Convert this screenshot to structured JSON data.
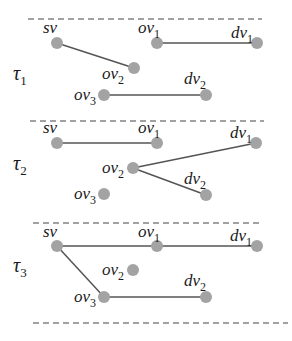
{
  "colors": {
    "node": "#a3a3a3",
    "edge": "#555555",
    "dash": "#444444",
    "text": "#1a1a1a",
    "background": "#ffffff"
  },
  "dividers": [
    {
      "y": 19,
      "x1": 28,
      "x2": 262
    },
    {
      "y": 121,
      "x1": 30,
      "x2": 264
    },
    {
      "y": 223,
      "x1": 33,
      "x2": 262
    },
    {
      "y": 323,
      "x1": 33,
      "x2": 288
    }
  ],
  "panels": [
    {
      "id": "tau1",
      "label": {
        "base": "τ",
        "sub": "1",
        "x": 13,
        "y": 80
      },
      "nodes": [
        {
          "id": "sv",
          "base": "sv",
          "sub": "",
          "x": 57,
          "y": 43,
          "lx": 43,
          "ly": 33
        },
        {
          "id": "ov1",
          "base": "ov",
          "sub": "1",
          "x": 157,
          "y": 43,
          "lx": 138,
          "ly": 33
        },
        {
          "id": "dv1",
          "base": "dv",
          "sub": "1",
          "x": 257,
          "y": 43,
          "lx": 231,
          "ly": 38
        },
        {
          "id": "ov2",
          "base": "ov",
          "sub": "2",
          "x": 134,
          "y": 68,
          "lx": 102,
          "ly": 79
        },
        {
          "id": "ov3",
          "base": "ov",
          "sub": "3",
          "x": 104,
          "y": 95,
          "lx": 74,
          "ly": 100
        },
        {
          "id": "dv2",
          "base": "dv",
          "sub": "2",
          "x": 206,
          "y": 95,
          "lx": 184,
          "ly": 84
        }
      ],
      "edges": [
        [
          "sv",
          "ov2"
        ],
        [
          "ov1",
          "dv1"
        ],
        [
          "ov3",
          "dv2"
        ]
      ]
    },
    {
      "id": "tau2",
      "label": {
        "base": "τ",
        "sub": "2",
        "x": 13,
        "y": 170
      },
      "nodes": [
        {
          "id": "sv",
          "base": "sv",
          "sub": "",
          "x": 57,
          "y": 143,
          "lx": 43,
          "ly": 133
        },
        {
          "id": "ov1",
          "base": "ov",
          "sub": "1",
          "x": 157,
          "y": 143,
          "lx": 138,
          "ly": 133
        },
        {
          "id": "dv1",
          "base": "dv",
          "sub": "1",
          "x": 256,
          "y": 143,
          "lx": 230,
          "ly": 138
        },
        {
          "id": "ov2",
          "base": "ov",
          "sub": "2",
          "x": 133,
          "y": 168,
          "lx": 102,
          "ly": 173
        },
        {
          "id": "ov3",
          "base": "ov",
          "sub": "3",
          "x": 104,
          "y": 194,
          "lx": 74,
          "ly": 199
        },
        {
          "id": "dv2",
          "base": "dv",
          "sub": "2",
          "x": 206,
          "y": 195,
          "lx": 184,
          "ly": 184
        }
      ],
      "edges": [
        [
          "sv",
          "ov1"
        ],
        [
          "ov2",
          "dv1"
        ],
        [
          "ov2",
          "dv2"
        ]
      ]
    },
    {
      "id": "tau3",
      "label": {
        "base": "τ",
        "sub": "3",
        "x": 13,
        "y": 272
      },
      "nodes": [
        {
          "id": "sv",
          "base": "sv",
          "sub": "",
          "x": 57,
          "y": 246,
          "lx": 43,
          "ly": 237
        },
        {
          "id": "ov1",
          "base": "ov",
          "sub": "1",
          "x": 157,
          "y": 246,
          "lx": 138,
          "ly": 237
        },
        {
          "id": "dv1",
          "base": "dv",
          "sub": "1",
          "x": 257,
          "y": 246,
          "lx": 230,
          "ly": 241
        },
        {
          "id": "ov2",
          "base": "ov",
          "sub": "2",
          "x": 133,
          "y": 270,
          "lx": 102,
          "ly": 275
        },
        {
          "id": "ov3",
          "base": "ov",
          "sub": "3",
          "x": 104,
          "y": 297,
          "lx": 74,
          "ly": 302
        },
        {
          "id": "dv2",
          "base": "dv",
          "sub": "2",
          "x": 206,
          "y": 297,
          "lx": 184,
          "ly": 286
        }
      ],
      "edges": [
        [
          "sv",
          "ov1"
        ],
        [
          "ov1",
          "dv1"
        ],
        [
          "sv",
          "ov3"
        ],
        [
          "ov3",
          "dv2"
        ]
      ]
    }
  ]
}
